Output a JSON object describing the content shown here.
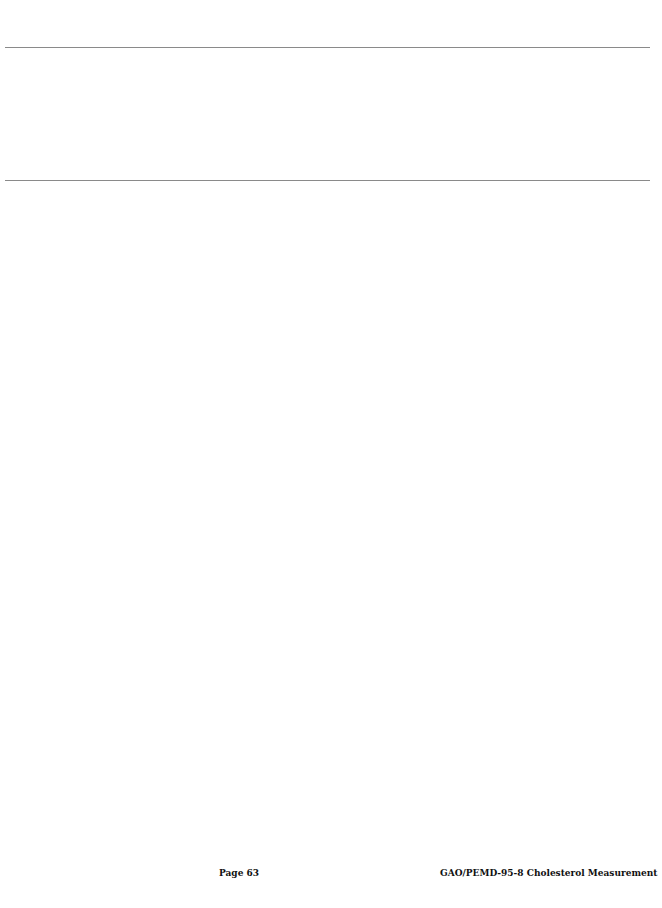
{
  "footer": {
    "page_label": "Page 63",
    "document_id": "GAO/PEMD-95-8 Cholesterol Measurement"
  }
}
